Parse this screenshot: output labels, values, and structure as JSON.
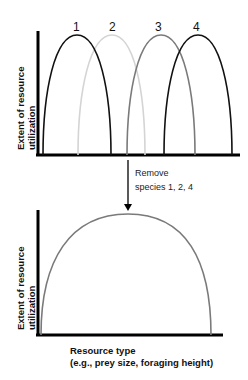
{
  "diagram": {
    "title": "",
    "top_panel": {
      "ylabel_line1": "Extent of resource",
      "ylabel_line2": "utilization",
      "species": [
        {
          "label": "1",
          "color": "#111111",
          "x_start": 43,
          "x_end": 111,
          "peak_x": 77
        },
        {
          "label": "2",
          "color": "#d4d4d4",
          "x_start": 78,
          "x_end": 145,
          "peak_x": 112
        },
        {
          "label": "3",
          "color": "#7a7a7a",
          "x_start": 127,
          "x_end": 195,
          "peak_x": 160
        },
        {
          "label": "4",
          "color": "#111111",
          "x_start": 164,
          "x_end": 232,
          "peak_x": 198
        }
      ]
    },
    "arrow": {
      "note_line1": "Remove",
      "note_line2": "species  1, 2,  4"
    },
    "bottom_panel": {
      "ylabel_line1": "Extent of resource",
      "ylabel_line2": "utilization",
      "curve": {
        "label": "3",
        "color": "#7a7a7a",
        "x_start": 41,
        "x_end": 211,
        "peak_x": 128
      }
    },
    "xlabel_line1": "Resource type",
    "xlabel_line2": "(e.g., prey size, foraging height)"
  }
}
